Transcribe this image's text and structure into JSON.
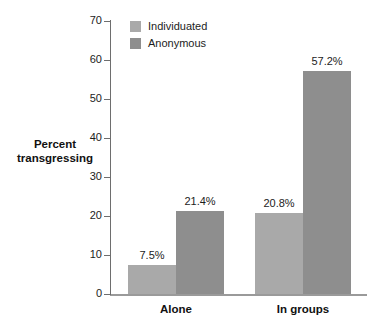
{
  "chart_data": {
    "type": "bar",
    "title": "",
    "xlabel": "",
    "ylabel": "Percent transgressing",
    "ylim": [
      0,
      70
    ],
    "ytick_step": 10,
    "yticks": [
      0,
      10,
      20,
      30,
      40,
      50,
      60,
      70
    ],
    "ytick_labels": [
      "0",
      "10",
      "20",
      "30",
      "40",
      "50",
      "60",
      "70"
    ],
    "grid": false,
    "legend_position": "top-left-inside",
    "categories": [
      "Alone",
      "In groups"
    ],
    "series": [
      {
        "name": "Individuated",
        "color": "#a9a9a9",
        "values": [
          7.5,
          20.8
        ],
        "value_labels": [
          "7.5%",
          "20.8%"
        ]
      },
      {
        "name": "Anonymous",
        "color": "#8e8e8e",
        "values": [
          21.4,
          57.2
        ],
        "value_labels": [
          "21.4%",
          "57.2%"
        ]
      }
    ]
  },
  "axis": {
    "y_title_line1": "Percent",
    "y_title_line2": "transgressing"
  },
  "colors": {
    "individuated": "#a9a9a9",
    "anonymous": "#8e8e8e",
    "axis": "#6e6e6e",
    "baseline": "#9a9a9a",
    "text": "#1c1c1c",
    "background": "#ffffff"
  }
}
